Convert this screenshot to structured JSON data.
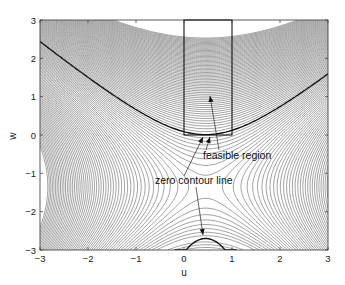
{
  "chart_data": {
    "type": "contour",
    "title": "",
    "xlabel": "u",
    "ylabel": "w",
    "xlim": [
      -3,
      3
    ],
    "ylim": [
      -3,
      3
    ],
    "xticks": [
      "-3",
      "-2",
      "-1",
      "0",
      "1",
      "2",
      "3"
    ],
    "yticks": [
      "3",
      "2",
      "1",
      "0",
      "-1",
      "-2",
      "-3"
    ],
    "grid": false,
    "legend": null,
    "feasible_region": {
      "u": [
        0,
        1
      ],
      "w": [
        0,
        3
      ]
    },
    "zero_contour": {
      "upper_branch": "hyperbola-like curve opening upward, vertex near (0.5, 0)",
      "lower_branch": "arc from u≈-0.2 to u≈1.1 near w=-3, peak ≈ (0.5, -2.7)"
    },
    "annotations": [
      {
        "text": "feasible region",
        "x": 0.12,
        "y": -0.55,
        "arrow_to": [
          [
            0.45,
            1.6
          ],
          [
            0.4,
            0.0
          ]
        ]
      },
      {
        "text": "zero contour line",
        "x": -1.35,
        "y": -1.1,
        "arrow_to": [
          [
            0.35,
            0.0
          ],
          [
            0.4,
            -2.7
          ]
        ]
      }
    ],
    "line_color": "#555555",
    "bold_line_color": "#111111"
  }
}
